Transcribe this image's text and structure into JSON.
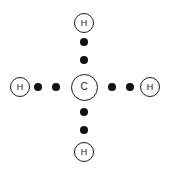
{
  "diagram": {
    "type": "lewis-dot-structure",
    "molecule_formula": "CH4",
    "molecule_name": "methane",
    "background_color": "#ffffff",
    "stroke_color": "#1a1a1a",
    "dot_color": "#111111",
    "canvas": {
      "width": 172,
      "height": 175
    },
    "central_atom": {
      "symbol": "C",
      "name": "carbon",
      "cx": 84,
      "cy": 87,
      "diameter": 27
    },
    "outer_atoms": [
      {
        "symbol": "H",
        "name": "hydrogen",
        "position": "top",
        "cx": 84,
        "cy": 23,
        "diameter": 20
      },
      {
        "symbol": "H",
        "name": "hydrogen",
        "position": "left",
        "cx": 20,
        "cy": 87,
        "diameter": 20
      },
      {
        "symbol": "H",
        "name": "hydrogen",
        "position": "right",
        "cx": 150,
        "cy": 87,
        "diameter": 20
      },
      {
        "symbol": "H",
        "name": "hydrogen",
        "position": "bottom",
        "cx": 84,
        "cy": 152,
        "diameter": 20
      }
    ],
    "bond_electron_pairs": [
      {
        "bond": "C-H top",
        "dots": [
          {
            "cx": 84,
            "cy": 42
          },
          {
            "cx": 84,
            "cy": 60
          }
        ]
      },
      {
        "bond": "C-H left",
        "dots": [
          {
            "cx": 38,
            "cy": 87
          },
          {
            "cx": 56,
            "cy": 87
          }
        ]
      },
      {
        "bond": "C-H right",
        "dots": [
          {
            "cx": 112,
            "cy": 87
          },
          {
            "cx": 130,
            "cy": 87
          }
        ]
      },
      {
        "bond": "C-H bottom",
        "dots": [
          {
            "cx": 84,
            "cy": 112
          },
          {
            "cx": 84,
            "cy": 130
          }
        ]
      }
    ],
    "dot_diameter": 8
  }
}
